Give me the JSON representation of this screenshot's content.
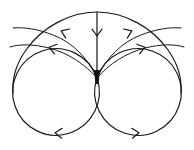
{
  "figure": {
    "background_color": "#ffffff",
    "stroke_color": "#151515",
    "width": 194,
    "height": 150
  },
  "chart_data": {
    "type": "diagram",
    "subtype": "phase-portrait",
    "grid": false,
    "legend": false,
    "axis_visible": false,
    "equilibrium_points": [
      {
        "name": "saddle-node",
        "x": 97,
        "y": 78,
        "label": ""
      }
    ],
    "curves": [
      {
        "name": "left-homoclinic-loop",
        "kind": "circle",
        "cx": 56,
        "cy": 92,
        "r": 42,
        "direction": "clockwise"
      },
      {
        "name": "right-homoclinic-loop",
        "kind": "circle",
        "cx": 138,
        "cy": 92,
        "r": 42,
        "direction": "counterclockwise"
      },
      {
        "name": "outer-separatrix-arc",
        "kind": "arc",
        "from_x": 14,
        "from_y": 92,
        "to_x": 180,
        "to_y": 92,
        "apex_x": 97,
        "apex_y": 12
      },
      {
        "name": "inner-left-arc",
        "kind": "arc",
        "from_x": 22,
        "from_y": 104,
        "to_x": 97,
        "to_y": 78
      },
      {
        "name": "inner-right-arc",
        "kind": "arc",
        "from_x": 172,
        "from_y": 104,
        "to_x": 97,
        "to_y": 78
      },
      {
        "name": "vertical-separatrix",
        "kind": "line",
        "from_x": 97,
        "from_y": 13,
        "to_x": 97,
        "to_y": 78
      }
    ],
    "arrows": [
      {
        "name": "arrow-vertical-separatrix",
        "x": 97,
        "y": 33,
        "angle": 90,
        "flow": "inward"
      },
      {
        "name": "arrow-outer-arc-left",
        "x": 64,
        "y": 32,
        "angle": 203,
        "flow": "inward"
      },
      {
        "name": "arrow-outer-arc-right",
        "x": 129,
        "y": 32,
        "angle": 337,
        "flow": "inward"
      },
      {
        "name": "arrow-inner-arc-left",
        "x": 52,
        "y": 48,
        "angle": 196,
        "flow": "inward"
      },
      {
        "name": "arrow-inner-arc-right",
        "x": 142,
        "y": 48,
        "angle": 344,
        "flow": "inward"
      },
      {
        "name": "arrow-left-loop-bottom",
        "x": 58,
        "y": 133,
        "angle": 184,
        "flow": "clockwise"
      },
      {
        "name": "arrow-right-loop-bottom",
        "x": 136,
        "y": 133,
        "angle": 356,
        "flow": "counterclockwise"
      }
    ]
  }
}
